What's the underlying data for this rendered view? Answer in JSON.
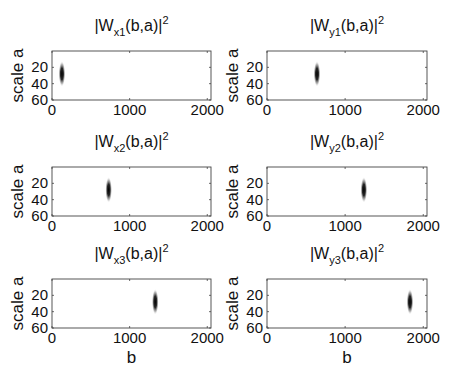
{
  "chart_data": [
    {
      "type": "heatmap",
      "title_main": "|W",
      "title_sub": "x1",
      "title_rest": "(b,a)|",
      "title_sup": "2",
      "xlabel": "",
      "ylabel": "scale a",
      "xlim": [
        0,
        2048
      ],
      "ylim": [
        0,
        60
      ],
      "xticks": [
        0,
        1000,
        2000
      ],
      "yticks": [
        20,
        40,
        60
      ],
      "blob": {
        "b_center": 128,
        "a_center": 28,
        "b_width": 20,
        "a_extent": [
          15,
          42
        ]
      }
    },
    {
      "type": "heatmap",
      "title_main": "|W",
      "title_sub": "y1",
      "title_rest": "(b,a)|",
      "title_sup": "2",
      "xlabel": "",
      "ylabel": "scale a",
      "xlim": [
        0,
        2048
      ],
      "ylim": [
        0,
        60
      ],
      "xticks": [
        0,
        1000,
        2000
      ],
      "yticks": [
        20,
        40,
        60
      ],
      "blob": {
        "b_center": 640,
        "a_center": 28,
        "b_width": 20,
        "a_extent": [
          15,
          42
        ]
      }
    },
    {
      "type": "heatmap",
      "title_main": "|W",
      "title_sub": "x2",
      "title_rest": "(b,a)|",
      "title_sup": "2",
      "xlabel": "",
      "ylabel": "scale a",
      "xlim": [
        0,
        2048
      ],
      "ylim": [
        0,
        60
      ],
      "xticks": [
        0,
        1000,
        2000
      ],
      "yticks": [
        20,
        40,
        60
      ],
      "blob": {
        "b_center": 730,
        "a_center": 28,
        "b_width": 20,
        "a_extent": [
          15,
          42
        ]
      }
    },
    {
      "type": "heatmap",
      "title_main": "|W",
      "title_sub": "y2",
      "title_rest": "(b,a)|",
      "title_sup": "2",
      "xlabel": "",
      "ylabel": "scale a",
      "xlim": [
        0,
        2048
      ],
      "ylim": [
        0,
        60
      ],
      "xticks": [
        0,
        1000,
        2000
      ],
      "yticks": [
        20,
        40,
        60
      ],
      "blob": {
        "b_center": 1240,
        "a_center": 28,
        "b_width": 20,
        "a_extent": [
          15,
          42
        ]
      }
    },
    {
      "type": "heatmap",
      "title_main": "|W",
      "title_sub": "x3",
      "title_rest": "(b,a)|",
      "title_sup": "2",
      "xlabel": "b",
      "ylabel": "scale a",
      "xlim": [
        0,
        2048
      ],
      "ylim": [
        0,
        60
      ],
      "xticks": [
        0,
        1000,
        2000
      ],
      "yticks": [
        20,
        40,
        60
      ],
      "blob": {
        "b_center": 1330,
        "a_center": 28,
        "b_width": 20,
        "a_extent": [
          15,
          42
        ]
      }
    },
    {
      "type": "heatmap",
      "title_main": "|W",
      "title_sub": "y3",
      "title_rest": "(b,a)|",
      "title_sup": "2",
      "xlabel": "b",
      "ylabel": "scale a",
      "xlim": [
        0,
        2048
      ],
      "ylim": [
        0,
        60
      ],
      "xticks": [
        0,
        1000,
        2000
      ],
      "yticks": [
        20,
        40,
        60
      ],
      "blob": {
        "b_center": 1830,
        "a_center": 28,
        "b_width": 20,
        "a_extent": [
          15,
          42
        ]
      }
    }
  ]
}
